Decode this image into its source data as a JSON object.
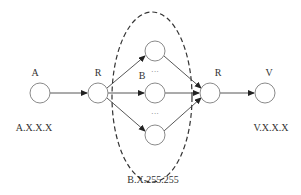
{
  "diagram": {
    "nodes": [
      {
        "id": "A",
        "label": "A",
        "address": "A.X.X.X"
      },
      {
        "id": "R1",
        "label": "R"
      },
      {
        "id": "Btop",
        "label": ""
      },
      {
        "id": "B",
        "label": "B"
      },
      {
        "id": "Bbottom",
        "label": ""
      },
      {
        "id": "R2",
        "label": "R"
      },
      {
        "id": "V",
        "label": "V",
        "address": "V.X.X.X"
      }
    ],
    "ellipsis_top": "···",
    "ellipsis_bottom": "···",
    "group_label": "B.X.255.255",
    "edges": [
      [
        "A",
        "R1"
      ],
      [
        "R1",
        "Btop"
      ],
      [
        "R1",
        "B"
      ],
      [
        "R1",
        "Bbottom"
      ],
      [
        "Btop",
        "R2"
      ],
      [
        "B",
        "R2"
      ],
      [
        "Bbottom",
        "R2"
      ],
      [
        "R2",
        "V"
      ]
    ],
    "colors": {
      "node_stroke": "#8a8a8a",
      "edge": "#444444",
      "text": "#333333"
    }
  }
}
